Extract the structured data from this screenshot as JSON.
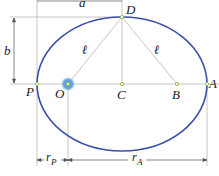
{
  "diagram": {
    "type": "ellipse-orbit",
    "colors": {
      "ellipse": "#3b4fa8",
      "guide_lines": "#b8b8b8",
      "point_marker": "#8fbf3f",
      "focus_glow": "#5aa0d8",
      "text": "#1a1a1a"
    },
    "points": {
      "P": "P",
      "O": "O",
      "C": "C",
      "B": "B",
      "A": "A",
      "D": "D"
    },
    "segment_labels": {
      "left_length": "ℓ",
      "right_length": "ℓ"
    },
    "dimensions": {
      "semi_major": "a",
      "semi_minor": "b",
      "r_perigee_main": "r",
      "r_perigee_sub": "P",
      "r_apogee_main": "r",
      "r_apogee_sub": "A"
    }
  }
}
